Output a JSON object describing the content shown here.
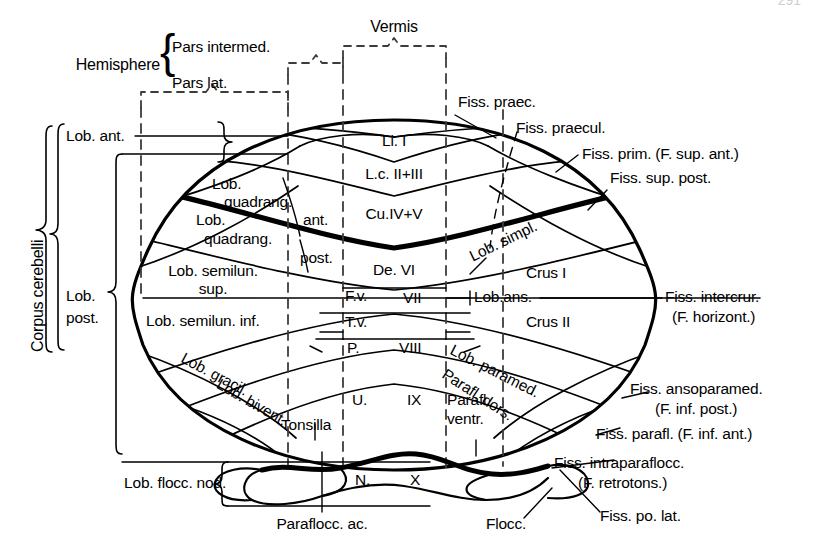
{
  "figure": {
    "page_number": "291"
  },
  "colors": {
    "ink": "#000000",
    "paper": "#ffffff",
    "dashed": "#555555"
  },
  "top_brackets": {
    "hemisphere_label": "Hemisphere",
    "pars_intermed": "Pars intermed.",
    "pars_lat": "Pars lat.",
    "vermis": "Vermis"
  },
  "left_brackets": {
    "corpus_cerebelli": "Corpus cerebelli",
    "lob_ant": "Lob. ant.",
    "lob_post_line1": "Lob.",
    "lob_post_line2": "post.",
    "lob_flocc_nod": "Lob. flocc. nod."
  },
  "vermis_segments": [
    {
      "id": "lingula",
      "label": "Li.  I"
    },
    {
      "id": "lobulus-centralis",
      "label": "L.c. II+III"
    },
    {
      "id": "culmen",
      "label": "Cu.IV+V"
    },
    {
      "id": "declive",
      "label": "De. VI"
    },
    {
      "id": "folium-vermis",
      "label": "F.v."
    },
    {
      "id": "vermis-seven",
      "label": "VII"
    },
    {
      "id": "tuber-vermis",
      "label": "T.v."
    },
    {
      "id": "pyramis",
      "label": "P."
    },
    {
      "id": "vermis-eight",
      "label": "VIII"
    },
    {
      "id": "uvula",
      "label": "U."
    },
    {
      "id": "vermis-nine",
      "label": "IX"
    },
    {
      "id": "nodulus",
      "label": "N."
    },
    {
      "id": "vermis-ten",
      "label": "X"
    }
  ],
  "hemisphere_labels": {
    "lob_quadrang_sup_l1": "Lob.",
    "lob_quadrang_sup_l2": "quadrang.",
    "lob_quadrang_ant": "ant.",
    "lob_quadrang_inf_l1": "Lob.",
    "lob_quadrang_inf_l2": "quadrang.",
    "lob_quadrang_post": "post.",
    "lob_semilun_sup_l1": "Lob. semilun.",
    "lob_semilun_sup_l2": "sup.",
    "lob_semilun_inf": "Lob. semilun. inf.",
    "lob_gracil": "Lob. gracil.",
    "lob_bivent": "Lob. bivent.",
    "tonsilla": "Tonsilla",
    "lob_simpl": "Lob. simpl.",
    "crus_i": "Crus I",
    "lob_ans": "Lob.ans.",
    "crus_ii": "Crus II",
    "lob_paramed": "Lob. paramed.",
    "parafl_dors": "Parafl. dors.",
    "parafl_ventr_l1": "Parafl.",
    "parafl_ventr_l2": "ventr."
  },
  "bottom_labels": {
    "paraflocc_ac": "Paraflocc. ac.",
    "flocc": "Flocc."
  },
  "fissure_labels": {
    "fiss_praec": "Fiss. praec.",
    "fiss_praecul": "Fiss. praecul.",
    "fiss_prim": "Fiss. prim. (F. sup. ant.)",
    "fiss_sup_post": "Fiss. sup. post.",
    "fiss_intercrur_l1": "Fiss. intercrur.",
    "fiss_intercrur_l2": "(F. horizont.)",
    "fiss_ansoparamed_l1": "Fiss. ansoparamed.",
    "fiss_ansoparamed_l2": "(F. inf. post.)",
    "fiss_parafl": "Fiss. parafl. (F. inf. ant.)",
    "fiss_intraparaflocc_l1": "Fiss. intraparaflocc.",
    "fiss_intraparaflocc_l2": "(F. retrotons.)",
    "fiss_po_lat": "Fiss. po. lat."
  }
}
